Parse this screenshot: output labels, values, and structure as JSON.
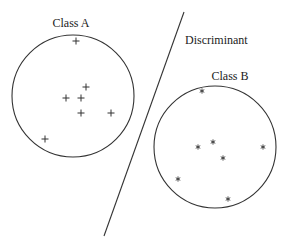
{
  "diagram": {
    "colors": {
      "stroke": "#333333",
      "text": "#222222",
      "background": "#ffffff"
    },
    "class_a": {
      "label": "Class A",
      "label_pos": {
        "x": 71,
        "y": 27
      },
      "circle": {
        "cx": 73,
        "cy": 96,
        "r": 61
      },
      "marker": "+",
      "points": [
        {
          "x": 76,
          "y": 41
        },
        {
          "x": 86,
          "y": 87
        },
        {
          "x": 66,
          "y": 98
        },
        {
          "x": 81,
          "y": 98
        },
        {
          "x": 81,
          "y": 113
        },
        {
          "x": 111,
          "y": 113
        },
        {
          "x": 45,
          "y": 139
        }
      ]
    },
    "class_b": {
      "label": "Class B",
      "label_pos": {
        "x": 230,
        "y": 80
      },
      "circle": {
        "cx": 215,
        "cy": 147,
        "r": 61
      },
      "marker": "*",
      "points": [
        {
          "x": 202,
          "y": 91
        },
        {
          "x": 213,
          "y": 142
        },
        {
          "x": 198,
          "y": 147
        },
        {
          "x": 223,
          "y": 158
        },
        {
          "x": 263,
          "y": 147
        },
        {
          "x": 178,
          "y": 179
        },
        {
          "x": 228,
          "y": 199
        }
      ]
    },
    "discriminant": {
      "label": "Discriminant",
      "label_pos": {
        "x": 185,
        "y": 44
      },
      "line": {
        "x1": 184,
        "y1": 12,
        "x2": 104,
        "y2": 236
      }
    }
  }
}
